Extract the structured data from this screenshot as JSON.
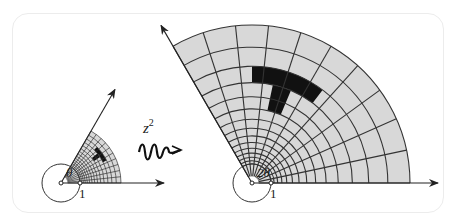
{
  "diagram": {
    "map_label": "z",
    "map_exponent": "2",
    "colors": {
      "grid_fill": "#d8d8d8",
      "line": "#333333",
      "highlight": "#111111",
      "frame": "#ececec"
    },
    "left": {
      "origin": [
        61,
        183
      ],
      "angle_deg": 60,
      "inner_radius": 19,
      "outer_radius": 60,
      "sectors": 10,
      "rings": 14,
      "axis_length": 103,
      "ray_length": 108,
      "angle_label": "θ",
      "unit_label": "1"
    },
    "right": {
      "origin": [
        252,
        183
      ],
      "angle_deg": 120,
      "inner_radius": 19,
      "outer_radius": 158,
      "sectors": 10,
      "rings": 14,
      "axis_length": 186,
      "ray_length": 182,
      "angle_label": "2θ",
      "unit_label": "1"
    },
    "highlight_shape": "T"
  }
}
